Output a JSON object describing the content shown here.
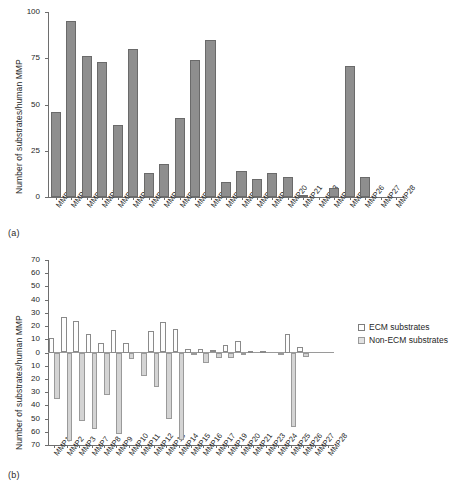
{
  "figure": {
    "panel_a_tag": "(a)",
    "panel_b_tag": "(b)"
  },
  "chart_data": [
    {
      "type": "bar",
      "panel": "(a)",
      "title": "",
      "xlabel": "",
      "ylabel": "Number of substrates/human MMP",
      "ylim": [
        0,
        100
      ],
      "yticks": [
        0,
        25,
        50,
        75,
        100
      ],
      "grid": false,
      "legend": null,
      "categories": [
        "MMP1",
        "MMP2",
        "MMP3",
        "MMP7",
        "MMP8",
        "MMP9",
        "MMP10",
        "MMP11",
        "MMP12",
        "MMP13",
        "MMP14",
        "MMP15",
        "MMP16",
        "MMP17",
        "MMP19",
        "MMP20",
        "MMP21",
        "MMP23",
        "MMP24",
        "MMP25",
        "MMP26",
        "MMP27",
        "MMP28"
      ],
      "values": [
        46,
        95,
        76,
        73,
        39,
        80,
        13,
        18,
        43,
        74,
        85,
        8,
        14,
        10,
        13,
        11,
        1,
        0,
        5,
        71,
        11,
        0,
        0
      ]
    },
    {
      "type": "bar",
      "panel": "(b)",
      "title": "",
      "xlabel": "",
      "ylabel": "Number of substrates/human MMP",
      "ylim": [
        -70,
        70
      ],
      "yticks": [
        70,
        60,
        50,
        40,
        30,
        20,
        10,
        0,
        10,
        20,
        30,
        40,
        50,
        60,
        70
      ],
      "grid": false,
      "legend_position": "right",
      "orientation": "bidirectional",
      "categories": [
        "MMP1",
        "MMP2",
        "MMP3",
        "MMP7",
        "MMP8",
        "MMP9",
        "MMP10",
        "MMP11",
        "MMP12",
        "MMP13",
        "MMP14",
        "MMP15",
        "MMP16",
        "MMP17",
        "MMP19",
        "MMP20",
        "MMP21",
        "MMP23",
        "MMP24",
        "MMP25",
        "MMP26",
        "MMP27",
        "MMP28"
      ],
      "series": [
        {
          "name": "ECM substrates",
          "direction": "up",
          "values": [
            11,
            27,
            24,
            14,
            7,
            17,
            7,
            0,
            16,
            23,
            18,
            3,
            3,
            2,
            6,
            9,
            1,
            1,
            0,
            14,
            4,
            0,
            0
          ]
        },
        {
          "name": "Non-ECM substrates",
          "direction": "down",
          "values": [
            35,
            67,
            52,
            58,
            32,
            62,
            5,
            18,
            26,
            50,
            66,
            2,
            8,
            4,
            4,
            1,
            0,
            0,
            2,
            56,
            3,
            0,
            0
          ]
        }
      ]
    }
  ],
  "panel_a": {
    "ylabel": "Number of substrates/human MMP",
    "yticks": [
      "0",
      "25",
      "50",
      "75",
      "100"
    ]
  },
  "panel_b": {
    "ylabel": "Number of substrates/human MMP",
    "yticks": [
      "70",
      "60",
      "50",
      "40",
      "30",
      "20",
      "10",
      "0",
      "10",
      "20",
      "30",
      "40",
      "50",
      "60",
      "70"
    ],
    "legend": [
      {
        "label": "ECM substrates",
        "swatch": "sw-ecm"
      },
      {
        "label": "Non-ECM substrates",
        "swatch": "sw-nonecm"
      }
    ]
  }
}
